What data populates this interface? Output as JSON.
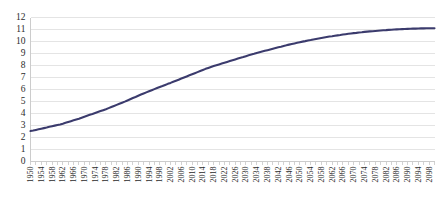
{
  "chart_data": {
    "type": "line",
    "title": "",
    "subtitle": "",
    "xlabel": "",
    "ylabel": "",
    "grid": true,
    "legend": false,
    "legend_position": "none",
    "xlim": [
      1950,
      2100
    ],
    "ylim": [
      0,
      12
    ],
    "ytick_step": 1,
    "xtick_step": 4,
    "series_color": "#3b3b6d",
    "yticks": [
      0,
      1,
      2,
      3,
      4,
      5,
      6,
      7,
      8,
      9,
      10,
      11,
      12
    ],
    "xticks": [
      "1950",
      "1954",
      "1958",
      "1962",
      "1966",
      "1970",
      "1974",
      "1978",
      "1982",
      "1986",
      "1990",
      "1994",
      "1998",
      "2002",
      "2006",
      "2010",
      "2014",
      "2018",
      "2022",
      "2026",
      "2030",
      "2034",
      "2038",
      "2042",
      "2046",
      "2050",
      "2054",
      "2058",
      "2062",
      "2066",
      "2070",
      "2074",
      "2078",
      "2082",
      "2086",
      "2090",
      "2094",
      "2098"
    ],
    "series": [
      {
        "name": "World population (billions)",
        "x": [
          1950,
          1951,
          1952,
          1953,
          1954,
          1955,
          1956,
          1957,
          1958,
          1959,
          1960,
          1961,
          1962,
          1963,
          1964,
          1965,
          1966,
          1967,
          1968,
          1969,
          1970,
          1971,
          1972,
          1973,
          1974,
          1975,
          1976,
          1977,
          1978,
          1979,
          1980,
          1981,
          1982,
          1983,
          1984,
          1985,
          1986,
          1987,
          1988,
          1989,
          1990,
          1991,
          1992,
          1993,
          1994,
          1995,
          1996,
          1997,
          1998,
          1999,
          2000,
          2001,
          2002,
          2003,
          2004,
          2005,
          2006,
          2007,
          2008,
          2009,
          2010,
          2011,
          2012,
          2013,
          2014,
          2015,
          2016,
          2017,
          2018,
          2019,
          2020,
          2021,
          2022,
          2023,
          2024,
          2025,
          2026,
          2027,
          2028,
          2029,
          2030,
          2031,
          2032,
          2033,
          2034,
          2035,
          2036,
          2037,
          2038,
          2039,
          2040,
          2041,
          2042,
          2043,
          2044,
          2045,
          2046,
          2047,
          2048,
          2049,
          2050,
          2051,
          2052,
          2053,
          2054,
          2055,
          2056,
          2057,
          2058,
          2059,
          2060,
          2061,
          2062,
          2063,
          2064,
          2065,
          2066,
          2067,
          2068,
          2069,
          2070,
          2071,
          2072,
          2073,
          2074,
          2075,
          2076,
          2077,
          2078,
          2079,
          2080,
          2081,
          2082,
          2083,
          2084,
          2085,
          2086,
          2087,
          2088,
          2089,
          2090,
          2091,
          2092,
          2093,
          2094,
          2095,
          2096,
          2097,
          2098,
          2099,
          2100
        ],
        "values": [
          2.54,
          2.58,
          2.63,
          2.68,
          2.73,
          2.78,
          2.83,
          2.89,
          2.94,
          2.99,
          3.04,
          3.09,
          3.15,
          3.22,
          3.29,
          3.36,
          3.43,
          3.5,
          3.57,
          3.65,
          3.73,
          3.81,
          3.89,
          3.96,
          4.04,
          4.12,
          4.2,
          4.28,
          4.36,
          4.45,
          4.54,
          4.63,
          4.72,
          4.81,
          4.9,
          4.99,
          5.09,
          5.19,
          5.29,
          5.38,
          5.48,
          5.58,
          5.67,
          5.76,
          5.85,
          5.94,
          6.03,
          6.12,
          6.21,
          6.29,
          6.38,
          6.47,
          6.55,
          6.64,
          6.73,
          6.82,
          6.91,
          7.0,
          7.09,
          7.18,
          7.27,
          7.36,
          7.45,
          7.54,
          7.63,
          7.72,
          7.8,
          7.88,
          7.95,
          8.02,
          8.09,
          8.16,
          8.23,
          8.3,
          8.37,
          8.44,
          8.51,
          8.58,
          8.65,
          8.71,
          8.78,
          8.85,
          8.91,
          8.97,
          9.04,
          9.1,
          9.16,
          9.22,
          9.28,
          9.34,
          9.4,
          9.46,
          9.52,
          9.57,
          9.63,
          9.68,
          9.74,
          9.79,
          9.84,
          9.89,
          9.94,
          9.99,
          10.03,
          10.08,
          10.12,
          10.17,
          10.21,
          10.25,
          10.29,
          10.33,
          10.37,
          10.41,
          10.44,
          10.48,
          10.51,
          10.54,
          10.58,
          10.61,
          10.64,
          10.67,
          10.7,
          10.72,
          10.75,
          10.77,
          10.8,
          10.82,
          10.84,
          10.86,
          10.88,
          10.9,
          10.92,
          10.94,
          10.95,
          10.97,
          10.98,
          11.0,
          11.01,
          11.02,
          11.03,
          11.04,
          11.05,
          11.06,
          11.07,
          11.07,
          11.08,
          11.09,
          11.09,
          11.1,
          11.1,
          11.11,
          11.11
        ]
      }
    ]
  }
}
